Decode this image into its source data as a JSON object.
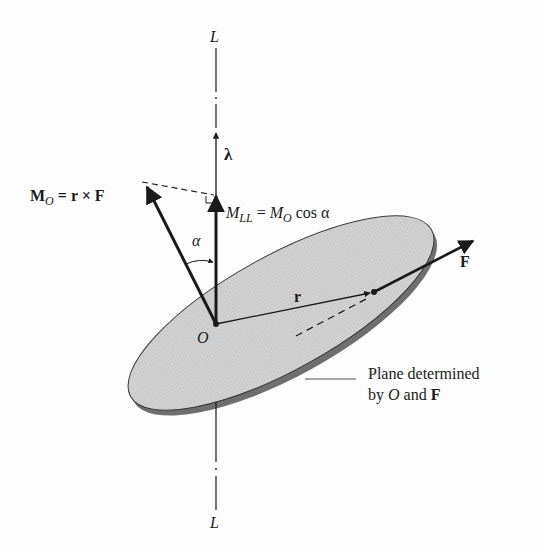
{
  "figure": {
    "axis": {
      "label_top": "L",
      "label_bottom": "L"
    },
    "unit_vector": {
      "label": "λ"
    },
    "moment_about_O": {
      "lhs_symbol": "M",
      "lhs_sub": "O",
      "rhs": " = r × F"
    },
    "moment_about_axis": {
      "lhs_symbol": "M",
      "lhs_sub": "LL",
      "eq": " = ",
      "rhs_symbol": "M",
      "rhs_sub": "O",
      "rhs_tail": " cos α"
    },
    "angle": {
      "label": "α"
    },
    "origin": {
      "label": "O"
    },
    "position_vector": {
      "label": "r"
    },
    "force": {
      "label": "F"
    },
    "plane_caption": {
      "line1": "Plane determined",
      "line2_prefix": "by ",
      "line2_O": "O",
      "line2_mid": " and ",
      "line2_F": "F"
    },
    "colors": {
      "plane_fill": "#cfcfcf",
      "plane_edge": "#7a7a7a",
      "ink": "#1a1a1a",
      "background": "#fdfdfd"
    }
  }
}
